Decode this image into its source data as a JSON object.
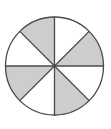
{
  "figure": {
    "name": "fraction-circle",
    "canvas": {
      "width": 111,
      "height": 129,
      "background": "#ffffff"
    },
    "circle": {
      "center_x": 54.5,
      "center_y": 66,
      "radius": 49,
      "stroke": "#4a4a4a",
      "stroke_width": 1.3,
      "unshaded_fill": "#ffffff",
      "shaded_fill": "#cdcdcd",
      "divider_stroke": "#4a4a4a",
      "divider_width": 1.3
    },
    "sector_count": 8,
    "sector_angle_degrees": 45,
    "shaded_count": 4,
    "unshaded_count": 4,
    "fraction_shaded": "4/8",
    "sectors": [
      {
        "index": 1,
        "start_deg": 0,
        "end_deg": 45,
        "clock_span": "12:00-1:30",
        "shaded": false
      },
      {
        "index": 2,
        "start_deg": 45,
        "end_deg": 90,
        "clock_span": "1:30-3:00",
        "shaded": true
      },
      {
        "index": 3,
        "start_deg": 90,
        "end_deg": 135,
        "clock_span": "3:00-4:30",
        "shaded": false
      },
      {
        "index": 4,
        "start_deg": 135,
        "end_deg": 180,
        "clock_span": "4:30-6:00",
        "shaded": true
      },
      {
        "index": 5,
        "start_deg": 180,
        "end_deg": 225,
        "clock_span": "6:00-7:30",
        "shaded": false
      },
      {
        "index": 6,
        "start_deg": 225,
        "end_deg": 270,
        "clock_span": "7:30-9:00",
        "shaded": true
      },
      {
        "index": 7,
        "start_deg": 270,
        "end_deg": 315,
        "clock_span": "9:00-10:30",
        "shaded": false
      },
      {
        "index": 8,
        "start_deg": 315,
        "end_deg": 360,
        "clock_span": "10:30-12:00",
        "shaded": true
      }
    ],
    "dividers": [
      {
        "index": 1,
        "angle_deg": 0,
        "label": "vertical-upper"
      },
      {
        "index": 2,
        "angle_deg": 45,
        "label": "diagonal-upper-right"
      },
      {
        "index": 3,
        "angle_deg": 90,
        "label": "horizontal-right"
      },
      {
        "index": 4,
        "angle_deg": 135,
        "label": "diagonal-lower-right"
      },
      {
        "index": 5,
        "angle_deg": 180,
        "label": "vertical-lower"
      },
      {
        "index": 6,
        "angle_deg": 225,
        "label": "diagonal-lower-left"
      },
      {
        "index": 7,
        "angle_deg": 270,
        "label": "horizontal-left"
      },
      {
        "index": 8,
        "angle_deg": 315,
        "label": "diagonal-upper-left"
      }
    ]
  }
}
